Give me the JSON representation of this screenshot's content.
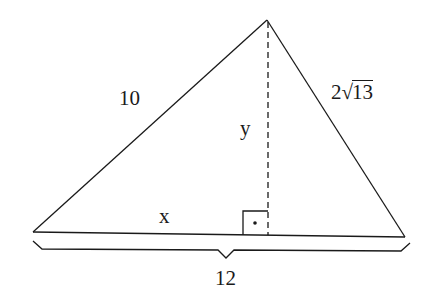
{
  "diagram": {
    "type": "triangle-with-altitude",
    "labels": {
      "left_side": "10",
      "right_side_coef": "2",
      "right_side_radical_sign": "√",
      "right_side_radicand": "13",
      "altitude": "y",
      "left_segment": "x",
      "base": "12"
    },
    "marks": [
      "right-angle-square-with-dot",
      "dashed-altitude",
      "brace-under-base"
    ],
    "stroke_color": "#1a1a1a"
  }
}
